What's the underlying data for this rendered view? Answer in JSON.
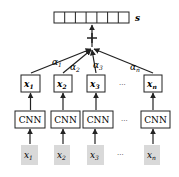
{
  "output_vector": {
    "label": "s",
    "cells": 7
  },
  "weights": [
    "α1",
    "α2",
    "α3",
    "αn"
  ],
  "weight_parts": [
    {
      "base": "α",
      "sub": "1"
    },
    {
      "base": "α",
      "sub": "2"
    },
    {
      "base": "α",
      "sub": "3"
    },
    {
      "base": "α",
      "sub": "n"
    }
  ],
  "encoded": [
    {
      "base": "x",
      "sub": "1"
    },
    {
      "base": "x",
      "sub": "2"
    },
    {
      "base": "x",
      "sub": "3"
    },
    {
      "base": "x",
      "sub": "n"
    }
  ],
  "encoder_label": "CNN",
  "inputs": [
    {
      "base": "x",
      "sub": "1"
    },
    {
      "base": "x",
      "sub": "2"
    },
    {
      "base": "x",
      "sub": "3"
    },
    {
      "base": "x",
      "sub": "n"
    }
  ],
  "ellipsis": "···",
  "colors": {
    "stroke": "#222222",
    "input_fill": "#d9d9d9"
  }
}
